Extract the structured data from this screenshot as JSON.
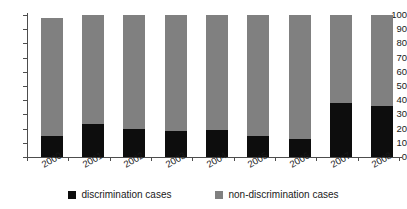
{
  "chart_data": {
    "type": "bar",
    "subtype": "stacked-100-percent",
    "title": "",
    "xlabel": "",
    "ylabel": "",
    "categories": [
      "2000",
      "2001",
      "2002",
      "2003",
      "2004",
      "2005",
      "2006",
      "2007",
      "2008"
    ],
    "series": [
      {
        "name": "discrimination cases",
        "color": "#0d0d0d",
        "values": [
          15,
          23,
          20,
          18,
          19,
          15,
          13,
          38,
          36
        ]
      },
      {
        "name": "non-discrimination cases",
        "color": "#808080",
        "values": [
          83,
          77,
          80,
          82,
          81,
          85,
          87,
          62,
          64
        ]
      }
    ],
    "bar_totals": [
      98,
      100,
      100,
      100,
      100,
      100,
      100,
      100,
      100
    ],
    "ylim": [
      0,
      100
    ],
    "ytick_labels": [
      "100",
      "90",
      "80",
      "70",
      "60",
      "50",
      "40",
      "30",
      "20",
      "10",
      "0"
    ],
    "ytick_values": [
      100,
      90,
      80,
      70,
      60,
      50,
      40,
      30,
      20,
      10,
      0
    ],
    "grid": false,
    "legend_position": "bottom",
    "legend": [
      {
        "label": "discrimination cases",
        "color": "#0d0d0d",
        "swatch": "black"
      },
      {
        "label": "non-discrimination cases",
        "color": "#808080",
        "swatch": "gray"
      }
    ],
    "axis_color": "#4d4d4d",
    "background": "#ffffff"
  }
}
